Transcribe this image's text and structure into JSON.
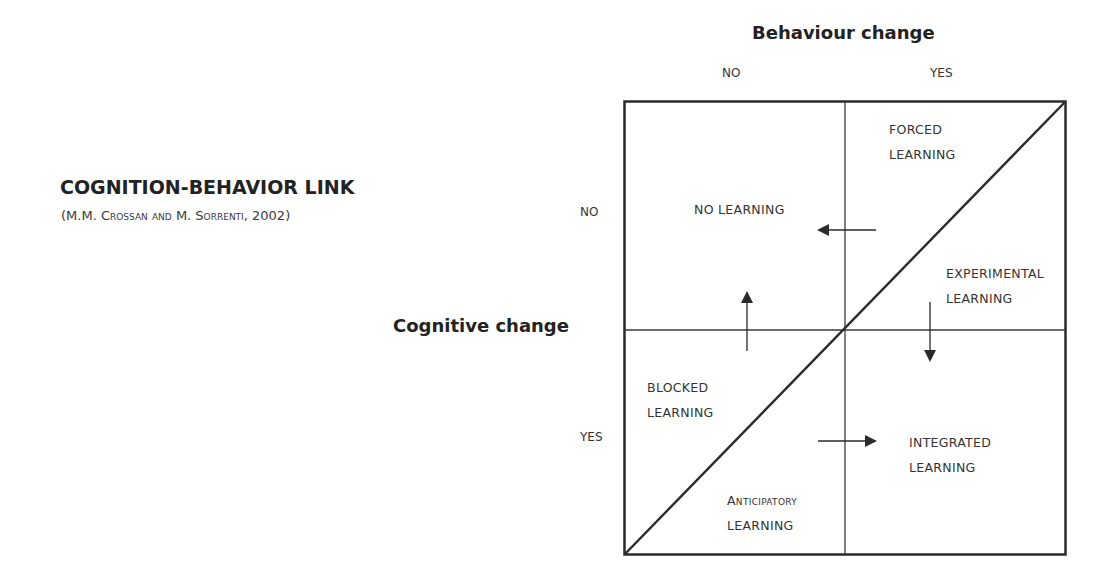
{
  "header": {
    "title": "COGNITION-BEHAVIOR LINK",
    "citation": "(M.M. Crossan and M. Sorrenti, 2002)"
  },
  "axes": {
    "horizontal": {
      "title": "Behaviour change",
      "ticks": [
        "NO",
        "YES"
      ]
    },
    "vertical": {
      "title": "Cognitive change",
      "ticks": [
        "NO",
        "YES"
      ]
    }
  },
  "quadrants": {
    "forced": {
      "line1": "FORCED",
      "line2": "LEARNING"
    },
    "no_learning": {
      "line1": "NO LEARNING"
    },
    "experimental": {
      "line1": "EXPERIMENTAL",
      "line2": "LEARNING"
    },
    "blocked": {
      "line1": "BLOCKED",
      "line2": "LEARNING"
    },
    "integrated": {
      "line1": "INTEGRATED",
      "line2": "LEARNING"
    },
    "anticipatory": {
      "line1": "Anticipatory",
      "line2": "LEARNING"
    }
  },
  "arrows": [
    {
      "name": "arrow-left",
      "direction": "left"
    },
    {
      "name": "arrow-up",
      "direction": "up"
    },
    {
      "name": "arrow-down",
      "direction": "down"
    },
    {
      "name": "arrow-right",
      "direction": "right"
    }
  ],
  "colors": {
    "line": "#2b2b2b",
    "text": "#333333",
    "background": "#ffffff"
  }
}
